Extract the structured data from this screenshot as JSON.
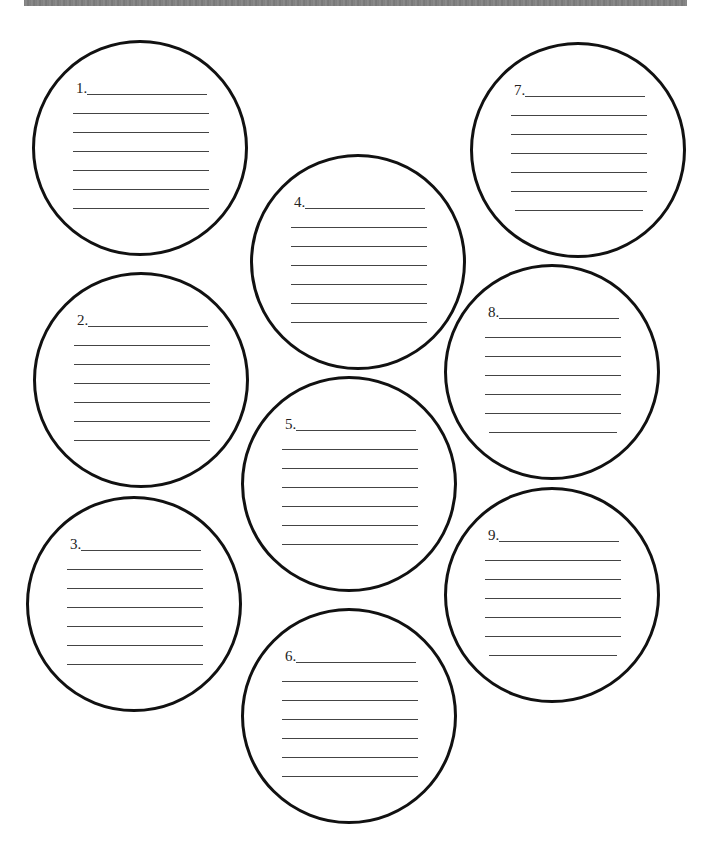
{
  "page": {
    "top_bar_color": "#808080",
    "circle_stroke_color": "#111111",
    "line_color": "#444444"
  },
  "bubbles": [
    {
      "number": "1.",
      "label": "1.",
      "cx": 140,
      "cy": 148,
      "lines": 6
    },
    {
      "number": "2.",
      "label": "2.",
      "cx": 141,
      "cy": 380,
      "lines": 6
    },
    {
      "number": "3.",
      "label": "3.",
      "cx": 134,
      "cy": 604,
      "lines": 6
    },
    {
      "number": "4.",
      "label": "4.",
      "cx": 358,
      "cy": 262,
      "lines": 6
    },
    {
      "number": "5.",
      "label": "5.",
      "cx": 349,
      "cy": 484,
      "lines": 6
    },
    {
      "number": "6.",
      "label": "6.",
      "cx": 349,
      "cy": 716,
      "lines": 6
    },
    {
      "number": "7.",
      "label": "7.",
      "cx": 578,
      "cy": 150,
      "lines": 6
    },
    {
      "number": "8.",
      "label": "8.",
      "cx": 552,
      "cy": 372,
      "lines": 6
    },
    {
      "number": "9.",
      "label": "9.",
      "cx": 552,
      "cy": 595,
      "lines": 6
    }
  ]
}
